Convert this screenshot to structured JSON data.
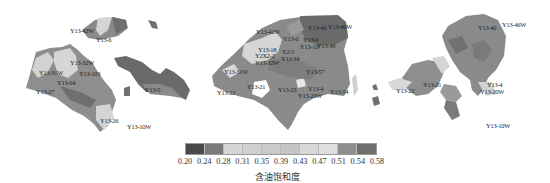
{
  "map": {
    "title": "",
    "panels": [
      {
        "id": "left",
        "wells": [
          {
            "name": "Y13-42W",
            "x": 70,
            "y": 28
          },
          {
            "name": "Y13-6",
            "x": 96,
            "y": 37
          },
          {
            "name": "Y13-32W",
            "x": 70,
            "y": 60
          },
          {
            "name": "Y13-31W",
            "x": 39,
            "y": 70
          },
          {
            "name": "Y13-103",
            "x": 79,
            "y": 71
          },
          {
            "name": "Y13-64",
            "x": 57,
            "y": 80
          },
          {
            "name": "Y13-27",
            "x": 36,
            "y": 89
          },
          {
            "name": "Y13-5",
            "x": 145,
            "y": 87
          },
          {
            "name": "Y13-26",
            "x": 100,
            "y": 118
          },
          {
            "name": "Y13-10W",
            "x": 127,
            "y": 124
          }
        ]
      },
      {
        "id": "center",
        "wells": [
          {
            "name": "Y13-42W",
            "x": 256,
            "y": 29
          },
          {
            "name": "Y13-40",
            "x": 308,
            "y": 25
          },
          {
            "name": "Y13-46W",
            "x": 328,
            "y": 24
          },
          {
            "name": "Y13-6",
            "x": 283,
            "y": 36
          },
          {
            "name": "Y13-9",
            "x": 303,
            "y": 37
          },
          {
            "name": "Y13-10",
            "x": 300,
            "y": 44
          },
          {
            "name": "Y13-39",
            "x": 317,
            "y": 43
          },
          {
            "name": "Y13-18",
            "x": 258,
            "y": 47
          },
          {
            "name": "Y2-5",
            "x": 282,
            "y": 49
          },
          {
            "name": "Y2X2-2",
            "x": 255,
            "y": 53
          },
          {
            "name": "Y13-34",
            "x": 281,
            "y": 56
          },
          {
            "name": "Y13-32W",
            "x": 255,
            "y": 60
          },
          {
            "name": "Y13-31W",
            "x": 224,
            "y": 69
          },
          {
            "name": "Y13-57",
            "x": 306,
            "y": 69
          },
          {
            "name": "Y13-21",
            "x": 247,
            "y": 84
          },
          {
            "name": "Y13-4",
            "x": 308,
            "y": 86
          },
          {
            "name": "Y13-23",
            "x": 278,
            "y": 87
          },
          {
            "name": "Y13-54",
            "x": 330,
            "y": 89
          },
          {
            "name": "Y13-22",
            "x": 217,
            "y": 90
          },
          {
            "name": "Y13-20W",
            "x": 298,
            "y": 93
          }
        ]
      },
      {
        "id": "right",
        "wells": [
          {
            "name": "Y13-46W",
            "x": 502,
            "y": 22
          },
          {
            "name": "Y13-40",
            "x": 478,
            "y": 25
          },
          {
            "name": "Y13-21",
            "x": 423,
            "y": 82
          },
          {
            "name": "Y13-22",
            "x": 396,
            "y": 88
          },
          {
            "name": "Y13-4",
            "x": 487,
            "y": 82
          },
          {
            "name": "Y13-20W",
            "x": 480,
            "y": 89
          },
          {
            "name": "Y13-10W",
            "x": 486,
            "y": 123
          }
        ]
      }
    ]
  },
  "legend": {
    "title": "含油饱和度",
    "ticks": [
      "0.20",
      "0.24",
      "0.28",
      "0.31",
      "0.35",
      "0.39",
      "0.43",
      "0.47",
      "0.51",
      "0.54",
      "0.58"
    ],
    "colors": [
      "#4a4a4a",
      "#7a7a7a",
      "#d6d6d6",
      "#d0d0d0",
      "#cacaca",
      "#c4c4c4",
      "#d8d8d8",
      "#e0e0e0",
      "#8e8e8e",
      "#6e6e6e"
    ]
  }
}
